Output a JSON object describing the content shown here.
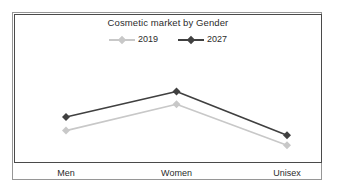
{
  "chart_data": {
    "type": "line",
    "title": "Cosmetic market by Gender",
    "xlabel": "",
    "ylabel": "",
    "categories": [
      "Men",
      "Women",
      "Unisex"
    ],
    "series": [
      {
        "name": "2019",
        "values": [
          29,
          58,
          13
        ],
        "color": "#c8c8c8",
        "marker": "diamond"
      },
      {
        "name": "2027",
        "values": [
          44,
          72,
          24
        ],
        "color": "#404040",
        "marker": "diamond"
      }
    ],
    "ylim": [
      0,
      100
    ],
    "grid": false,
    "y_tick_labels": [],
    "legend_position": "top-center",
    "annotations": []
  },
  "figure": {
    "border_color": "#969696",
    "plot_border_color": "#4a4a4a",
    "background": "#ffffff"
  }
}
